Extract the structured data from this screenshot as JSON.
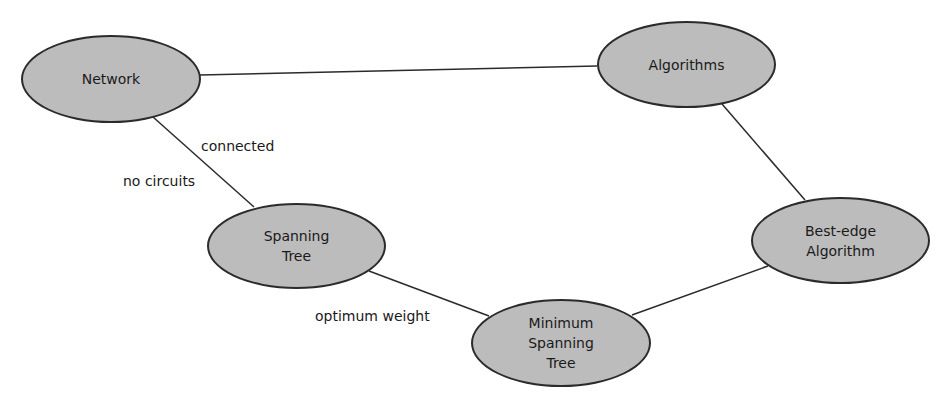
{
  "diagram": {
    "type": "concept-map",
    "colors": {
      "node_fill": "#bcbcbc",
      "node_stroke": "#2b2b2b",
      "edge_stroke": "#2b2b2b",
      "text": "#1a1a1a",
      "background": "#ffffff"
    },
    "nodes": [
      {
        "id": "network",
        "label": "Network"
      },
      {
        "id": "algorithms",
        "label": "Algorithms"
      },
      {
        "id": "spanning_tree",
        "label": "Spanning\nTree"
      },
      {
        "id": "minimum_spanning_tree",
        "label": "Minimum\nSpanning\nTree"
      },
      {
        "id": "best_edge_algorithm",
        "label": "Best-edge\nAlgorithm"
      }
    ],
    "edges": [
      {
        "from": "network",
        "to": "algorithms",
        "labels": []
      },
      {
        "from": "network",
        "to": "spanning_tree",
        "labels": [
          "connected",
          "no circuits"
        ]
      },
      {
        "from": "spanning_tree",
        "to": "minimum_spanning_tree",
        "labels": [
          "optimum weight"
        ]
      },
      {
        "from": "algorithms",
        "to": "best_edge_algorithm",
        "labels": []
      },
      {
        "from": "minimum_spanning_tree",
        "to": "best_edge_algorithm",
        "labels": []
      }
    ],
    "edge_labels": {
      "connected": "connected",
      "no_circuits": "no circuits",
      "optimum_weight": "optimum weight"
    }
  }
}
